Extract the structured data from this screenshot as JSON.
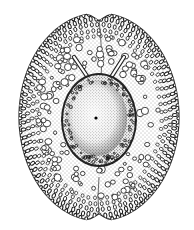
{
  "figure": {
    "colors": {
      "background": "#ffffff",
      "ink": "#1a1a1a",
      "stipple": "#333333"
    },
    "outer_body": {
      "cx": 99,
      "cy": 117,
      "rx": 80,
      "ry": 104
    },
    "nucleus": {
      "cx": 99,
      "cy": 120,
      "rx": 36,
      "ry": 45
    },
    "center_dot": {
      "cx": 96,
      "cy": 118,
      "r": 1.6
    },
    "horns": [
      {
        "x1": 74,
        "y1": 57,
        "x2": 89,
        "y2": 79
      },
      {
        "x1": 124,
        "y1": 57,
        "x2": 110,
        "y2": 79
      }
    ]
  }
}
